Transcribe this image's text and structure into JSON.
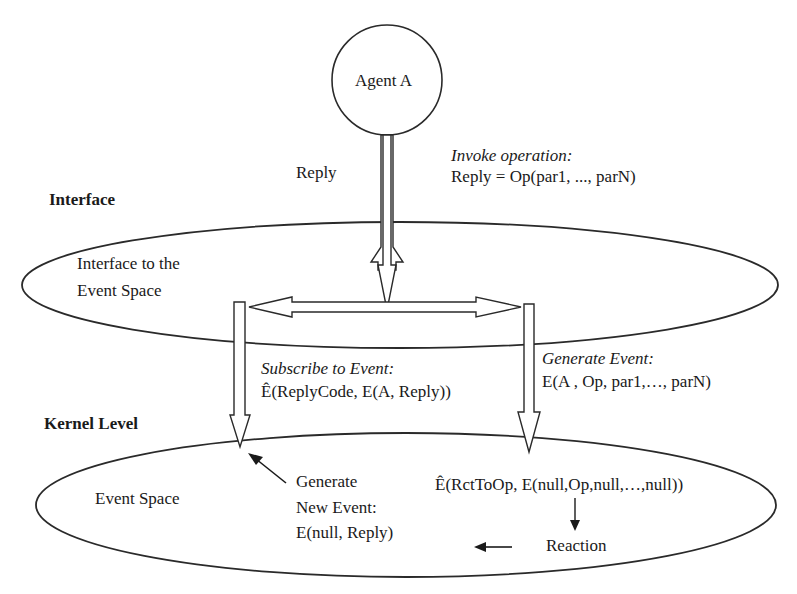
{
  "diagram": {
    "agent": {
      "label": "Agent A"
    },
    "levels": {
      "interface": "Interface",
      "kernel": "Kernel Level"
    },
    "interface_ellipse": {
      "label_line1": "Interface to the",
      "label_line2": "Event Space"
    },
    "event_space_ellipse": {
      "label": "Event Space"
    },
    "reply_label": "Reply",
    "invoke": {
      "title": "Invoke operation:",
      "expr": "Reply = Op(par1, ..., parN)"
    },
    "subscribe": {
      "title": "Subscribe to Event:",
      "expr": "Ê(ReplyCode, E(A, Reply))"
    },
    "generate": {
      "title": "Generate Event:",
      "expr": "E(A , Op, par1,…, parN)"
    },
    "new_event": {
      "line1": "Generate",
      "line2": "New Event:",
      "line3": "E(null, Reply)"
    },
    "reaction_subscription": "Ê(RctToOp, E(null,Op,null,…,null))",
    "reaction": "Reaction",
    "colors": {
      "stroke": "#2a2a2a",
      "background": "#ffffff"
    }
  }
}
